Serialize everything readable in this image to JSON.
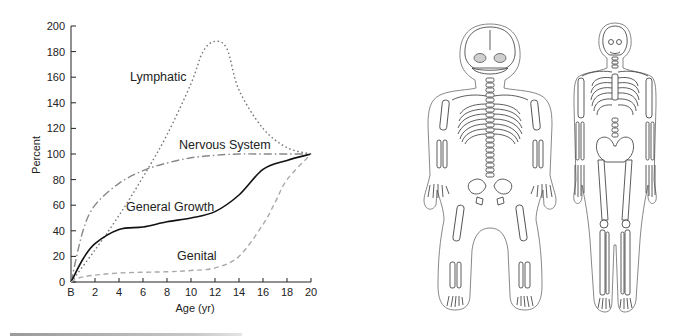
{
  "chart_data": {
    "type": "line",
    "title": "",
    "xlabel": "Age (yr)",
    "ylabel": "Percent",
    "xlim": [
      0,
      20
    ],
    "ylim": [
      0,
      200
    ],
    "x_ticks": [
      "B",
      "2",
      "4",
      "6",
      "8",
      "10",
      "12",
      "14",
      "16",
      "18",
      "20"
    ],
    "y_ticks": [
      "0",
      "20",
      "40",
      "60",
      "80",
      "100",
      "120",
      "140",
      "160",
      "180",
      "200"
    ],
    "grid": false,
    "legend": "inline labels",
    "series": [
      {
        "name": "Lymphatic",
        "style": "dotted",
        "color": "#777777",
        "x": [
          0,
          2,
          4,
          6,
          8,
          10,
          11,
          12,
          13,
          14,
          16,
          18,
          20
        ],
        "values": [
          0,
          25,
          52,
          82,
          115,
          155,
          180,
          188,
          182,
          150,
          120,
          105,
          100
        ]
      },
      {
        "name": "Nervous System",
        "style": "dash-dot",
        "color": "#888888",
        "x": [
          0,
          1,
          2,
          4,
          6,
          8,
          10,
          12,
          14,
          16,
          18,
          20
        ],
        "values": [
          0,
          40,
          60,
          77,
          87,
          93,
          97,
          99,
          100,
          100,
          100,
          100
        ]
      },
      {
        "name": "General Growth",
        "style": "solid",
        "color": "#111111",
        "x": [
          0,
          1,
          2,
          4,
          6,
          8,
          10,
          12,
          14,
          16,
          18,
          20
        ],
        "values": [
          0,
          18,
          30,
          41,
          43,
          47,
          50,
          55,
          68,
          88,
          95,
          100
        ]
      },
      {
        "name": "Genital",
        "style": "dashed",
        "color": "#aaaaaa",
        "x": [
          0,
          1,
          4,
          8,
          10,
          12,
          14,
          16,
          17,
          18,
          20
        ],
        "values": [
          0,
          4,
          7,
          8,
          9,
          11,
          20,
          45,
          62,
          80,
          100
        ]
      }
    ]
  },
  "labels": {
    "lymphatic": "Lymphatic",
    "nervous": "Nervous System",
    "general": "General Growth",
    "genital": "Genital",
    "ylabel": "Percent",
    "xlabel": "Age (yr)"
  },
  "illustration": {
    "left_figure": "newborn skeleton",
    "right_figure": "adult skeleton"
  }
}
